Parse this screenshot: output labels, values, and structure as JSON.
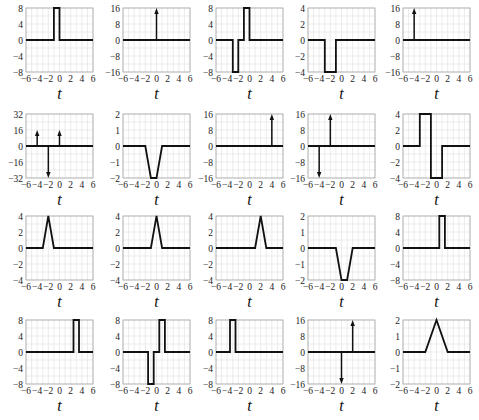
{
  "layout": {
    "cols_x": [
      26,
      123,
      216,
      308,
      403
    ],
    "rows_y": [
      8,
      114,
      216,
      320
    ],
    "plot_w": 67,
    "plot_h": 64
  },
  "chart_data": [
    {
      "type": "line",
      "row": 0,
      "col": 0,
      "xlabel": "t",
      "xlim": [
        -6,
        6
      ],
      "ylim": [
        -8,
        8
      ],
      "yticks": [
        -8,
        -4,
        0,
        4,
        8
      ],
      "xticks": [
        -6,
        -4,
        -2,
        0,
        2,
        4,
        6
      ],
      "points": [
        [
          -6,
          0
        ],
        [
          -1,
          0
        ],
        [
          -1,
          8
        ],
        [
          0,
          8
        ],
        [
          0,
          0
        ],
        [
          6,
          0
        ]
      ],
      "impulses": []
    },
    {
      "type": "line",
      "row": 0,
      "col": 1,
      "xlabel": "t",
      "xlim": [
        -6,
        6
      ],
      "ylim": [
        -16,
        16
      ],
      "yticks": [
        -16,
        -8,
        0,
        8,
        16
      ],
      "xticks": [
        -6,
        -4,
        -2,
        0,
        2,
        4,
        6
      ],
      "points": [
        [
          -6,
          0
        ],
        [
          6,
          0
        ]
      ],
      "impulses": [
        [
          0,
          16
        ]
      ]
    },
    {
      "type": "line",
      "row": 0,
      "col": 2,
      "xlabel": "t",
      "xlim": [
        -6,
        6
      ],
      "ylim": [
        -8,
        8
      ],
      "yticks": [
        -8,
        -4,
        0,
        4,
        8
      ],
      "xticks": [
        -6,
        -4,
        -2,
        0,
        2,
        4,
        6
      ],
      "points": [
        [
          -6,
          0
        ],
        [
          -3,
          0
        ],
        [
          -3,
          -8
        ],
        [
          -2,
          -8
        ],
        [
          -2,
          0
        ],
        [
          -1,
          0
        ],
        [
          -1,
          8
        ],
        [
          0,
          8
        ],
        [
          0,
          0
        ],
        [
          6,
          0
        ]
      ],
      "impulses": []
    },
    {
      "type": "line",
      "row": 0,
      "col": 3,
      "xlabel": "t",
      "xlim": [
        -6,
        6
      ],
      "ylim": [
        -4,
        4
      ],
      "yticks": [
        -4,
        -2,
        0,
        2,
        4
      ],
      "xticks": [
        -6,
        -4,
        -2,
        0,
        2,
        4,
        6
      ],
      "points": [
        [
          -6,
          0
        ],
        [
          -3,
          0
        ],
        [
          -3,
          -4
        ],
        [
          -1,
          -4
        ],
        [
          -1,
          0
        ],
        [
          6,
          0
        ]
      ],
      "impulses": []
    },
    {
      "type": "line",
      "row": 0,
      "col": 4,
      "xlabel": "t",
      "xlim": [
        -6,
        6
      ],
      "ylim": [
        -16,
        16
      ],
      "yticks": [
        -16,
        -8,
        0,
        8,
        16
      ],
      "xticks": [
        -6,
        -4,
        -2,
        0,
        2,
        4,
        6
      ],
      "points": [
        [
          -6,
          0
        ],
        [
          6,
          0
        ]
      ],
      "impulses": [
        [
          -4,
          16
        ]
      ]
    },
    {
      "type": "line",
      "row": 1,
      "col": 0,
      "xlabel": "t",
      "xlim": [
        -6,
        6
      ],
      "ylim": [
        -32,
        32
      ],
      "yticks": [
        -32,
        -16,
        0,
        16,
        32
      ],
      "xticks": [
        -6,
        -4,
        -2,
        0,
        2,
        4,
        6
      ],
      "points": [
        [
          -6,
          0
        ],
        [
          6,
          0
        ]
      ],
      "impulses": [
        [
          -4,
          16
        ],
        [
          -2,
          -32
        ],
        [
          0,
          16
        ]
      ]
    },
    {
      "type": "line",
      "row": 1,
      "col": 1,
      "xlabel": "t",
      "xlim": [
        -6,
        6
      ],
      "ylim": [
        -2,
        2
      ],
      "yticks": [
        -2,
        -1,
        0,
        1,
        2
      ],
      "xticks": [
        -6,
        -4,
        -2,
        0,
        2,
        4,
        6
      ],
      "points": [
        [
          -6,
          0
        ],
        [
          -2,
          0
        ],
        [
          -1,
          -2
        ],
        [
          0,
          -2
        ],
        [
          1,
          0
        ],
        [
          6,
          0
        ]
      ],
      "impulses": []
    },
    {
      "type": "line",
      "row": 1,
      "col": 2,
      "xlabel": "t",
      "xlim": [
        -6,
        6
      ],
      "ylim": [
        -16,
        16
      ],
      "yticks": [
        -16,
        -8,
        0,
        8,
        16
      ],
      "xticks": [
        -6,
        -4,
        -2,
        0,
        2,
        4,
        6
      ],
      "points": [
        [
          -6,
          0
        ],
        [
          6,
          0
        ]
      ],
      "impulses": [
        [
          4,
          16
        ]
      ]
    },
    {
      "type": "line",
      "row": 1,
      "col": 3,
      "xlabel": "t",
      "xlim": [
        -6,
        6
      ],
      "ylim": [
        -16,
        16
      ],
      "yticks": [
        -16,
        -8,
        0,
        8,
        16
      ],
      "xticks": [
        -6,
        -4,
        -2,
        0,
        2,
        4,
        6
      ],
      "points": [
        [
          -6,
          0
        ],
        [
          6,
          0
        ]
      ],
      "impulses": [
        [
          -4,
          -16
        ],
        [
          -2,
          16
        ]
      ]
    },
    {
      "type": "line",
      "row": 1,
      "col": 4,
      "xlabel": "t",
      "xlim": [
        -6,
        6
      ],
      "ylim": [
        -4,
        4
      ],
      "yticks": [
        -4,
        -2,
        0,
        2,
        4
      ],
      "xticks": [
        -6,
        -4,
        -2,
        0,
        2,
        4,
        6
      ],
      "points": [
        [
          -6,
          0
        ],
        [
          -3,
          0
        ],
        [
          -3,
          4
        ],
        [
          -1,
          4
        ],
        [
          -1,
          -4
        ],
        [
          1,
          -4
        ],
        [
          1,
          0
        ],
        [
          6,
          0
        ]
      ],
      "impulses": []
    },
    {
      "type": "line",
      "row": 2,
      "col": 0,
      "xlabel": "t",
      "xlim": [
        -6,
        6
      ],
      "ylim": [
        -4,
        4
      ],
      "yticks": [
        -4,
        -2,
        0,
        2,
        4
      ],
      "xticks": [
        -6,
        -4,
        -2,
        0,
        2,
        4,
        6
      ],
      "points": [
        [
          -6,
          0
        ],
        [
          -3,
          0
        ],
        [
          -2,
          4
        ],
        [
          -1,
          0
        ],
        [
          6,
          0
        ]
      ],
      "impulses": []
    },
    {
      "type": "line",
      "row": 2,
      "col": 1,
      "xlabel": "t",
      "xlim": [
        -6,
        6
      ],
      "ylim": [
        -4,
        4
      ],
      "yticks": [
        -4,
        -2,
        0,
        2,
        4
      ],
      "xticks": [
        -6,
        -4,
        -2,
        0,
        2,
        4,
        6
      ],
      "points": [
        [
          -6,
          0
        ],
        [
          -1,
          0
        ],
        [
          0,
          4
        ],
        [
          1,
          0
        ],
        [
          6,
          0
        ]
      ],
      "impulses": []
    },
    {
      "type": "line",
      "row": 2,
      "col": 2,
      "xlabel": "t",
      "xlim": [
        -6,
        6
      ],
      "ylim": [
        -4,
        4
      ],
      "yticks": [
        -4,
        -2,
        0,
        2,
        4
      ],
      "xticks": [
        -6,
        -4,
        -2,
        0,
        2,
        4,
        6
      ],
      "points": [
        [
          -6,
          0
        ],
        [
          1,
          0
        ],
        [
          2,
          4
        ],
        [
          3,
          0
        ],
        [
          6,
          0
        ]
      ],
      "impulses": []
    },
    {
      "type": "line",
      "row": 2,
      "col": 3,
      "xlabel": "t",
      "xlim": [
        -6,
        6
      ],
      "ylim": [
        -2,
        2
      ],
      "yticks": [
        -2,
        -1,
        0,
        1,
        2
      ],
      "xticks": [
        -6,
        -4,
        -2,
        0,
        2,
        4,
        6
      ],
      "points": [
        [
          -6,
          0
        ],
        [
          -1,
          0
        ],
        [
          0,
          -2
        ],
        [
          1,
          -2
        ],
        [
          2,
          0
        ],
        [
          6,
          0
        ]
      ],
      "impulses": []
    },
    {
      "type": "line",
      "row": 2,
      "col": 4,
      "xlabel": "t",
      "xlim": [
        -6,
        6
      ],
      "ylim": [
        -8,
        8
      ],
      "yticks": [
        -8,
        -4,
        0,
        4,
        8
      ],
      "xticks": [
        -6,
        -4,
        -2,
        0,
        2,
        4,
        6
      ],
      "points": [
        [
          -6,
          0
        ],
        [
          0.5,
          0
        ],
        [
          0.5,
          8
        ],
        [
          1.5,
          8
        ],
        [
          1.5,
          0
        ],
        [
          6,
          0
        ]
      ],
      "impulses": []
    },
    {
      "type": "line",
      "row": 3,
      "col": 0,
      "xlabel": "t",
      "xlim": [
        -6,
        6
      ],
      "ylim": [
        -8,
        8
      ],
      "yticks": [
        -8,
        -4,
        0,
        4,
        8
      ],
      "xticks": [
        -6,
        -4,
        -2,
        0,
        2,
        4,
        6
      ],
      "points": [
        [
          -6,
          0
        ],
        [
          2.5,
          0
        ],
        [
          2.5,
          8
        ],
        [
          3.5,
          8
        ],
        [
          3.5,
          0
        ],
        [
          6,
          0
        ]
      ],
      "impulses": []
    },
    {
      "type": "line",
      "row": 3,
      "col": 1,
      "xlabel": "t",
      "xlim": [
        -6,
        6
      ],
      "ylim": [
        -8,
        8
      ],
      "yticks": [
        -8,
        -4,
        0,
        4,
        8
      ],
      "xticks": [
        -6,
        -4,
        -2,
        0,
        2,
        4,
        6
      ],
      "points": [
        [
          -6,
          0
        ],
        [
          -1.5,
          0
        ],
        [
          -1.5,
          -8
        ],
        [
          -0.5,
          -8
        ],
        [
          -0.5,
          0
        ],
        [
          0.5,
          0
        ],
        [
          0.5,
          8
        ],
        [
          1.5,
          8
        ],
        [
          1.5,
          0
        ],
        [
          6,
          0
        ]
      ],
      "impulses": []
    },
    {
      "type": "line",
      "row": 3,
      "col": 2,
      "xlabel": "t",
      "xlim": [
        -6,
        6
      ],
      "ylim": [
        -8,
        8
      ],
      "yticks": [
        -8,
        -4,
        0,
        4,
        8
      ],
      "xticks": [
        -6,
        -4,
        -2,
        0,
        2,
        4,
        6
      ],
      "points": [
        [
          -6,
          0
        ],
        [
          -3.5,
          0
        ],
        [
          -3.5,
          8
        ],
        [
          -2.5,
          8
        ],
        [
          -2.5,
          0
        ],
        [
          6,
          0
        ]
      ],
      "impulses": []
    },
    {
      "type": "line",
      "row": 3,
      "col": 3,
      "xlabel": "t",
      "xlim": [
        -6,
        6
      ],
      "ylim": [
        -16,
        16
      ],
      "yticks": [
        -16,
        -8,
        0,
        8,
        16
      ],
      "xticks": [
        -6,
        -4,
        -2,
        0,
        2,
        4,
        6
      ],
      "points": [
        [
          -6,
          0
        ],
        [
          6,
          0
        ]
      ],
      "impulses": [
        [
          0,
          -16
        ],
        [
          2,
          16
        ]
      ]
    },
    {
      "type": "line",
      "row": 3,
      "col": 4,
      "xlabel": "t",
      "xlim": [
        -6,
        6
      ],
      "ylim": [
        -2,
        2
      ],
      "yticks": [
        -2,
        -1,
        0,
        1,
        2
      ],
      "xticks": [
        -6,
        -4,
        -2,
        0,
        2,
        4,
        6
      ],
      "points": [
        [
          -6,
          0
        ],
        [
          -2,
          0
        ],
        [
          0,
          2
        ],
        [
          2,
          0
        ],
        [
          6,
          0
        ]
      ],
      "impulses": []
    }
  ]
}
